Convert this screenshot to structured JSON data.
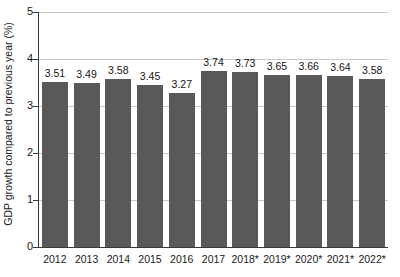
{
  "chart_data": {
    "type": "bar",
    "title": "",
    "subtitle": "",
    "xlabel": "",
    "ylabel": "GDP growth compared to previous year (%)",
    "categories": [
      "2012",
      "2013",
      "2014",
      "2015",
      "2016",
      "2017",
      "2018*",
      "2019*",
      "2020*",
      "2021*",
      "2022*"
    ],
    "values": [
      3.51,
      3.49,
      3.58,
      3.45,
      3.27,
      3.74,
      3.73,
      3.65,
      3.66,
      3.64,
      3.58
    ],
    "value_labels": [
      "3.51",
      "3.49",
      "3.58",
      "3.45",
      "3.27",
      "3.74",
      "3.73",
      "3.65",
      "3.66",
      "3.64",
      "3.58"
    ],
    "ylim": [
      0,
      5
    ],
    "ytick_labels": [
      "0",
      "1",
      "2",
      "3",
      "4",
      "5"
    ],
    "ytick_values": [
      0,
      1,
      2,
      3,
      4,
      5
    ],
    "grid": true,
    "grid_axis": "y",
    "legend": false,
    "legend_position": "none",
    "bar_color": "#595959",
    "grid_color": "#c9c9c9",
    "axis_color": "#3a3a3a",
    "background_color": "#ffffff",
    "text_color": "#1a1a1a",
    "annotations": [
      "* denotes projected values"
    ]
  }
}
